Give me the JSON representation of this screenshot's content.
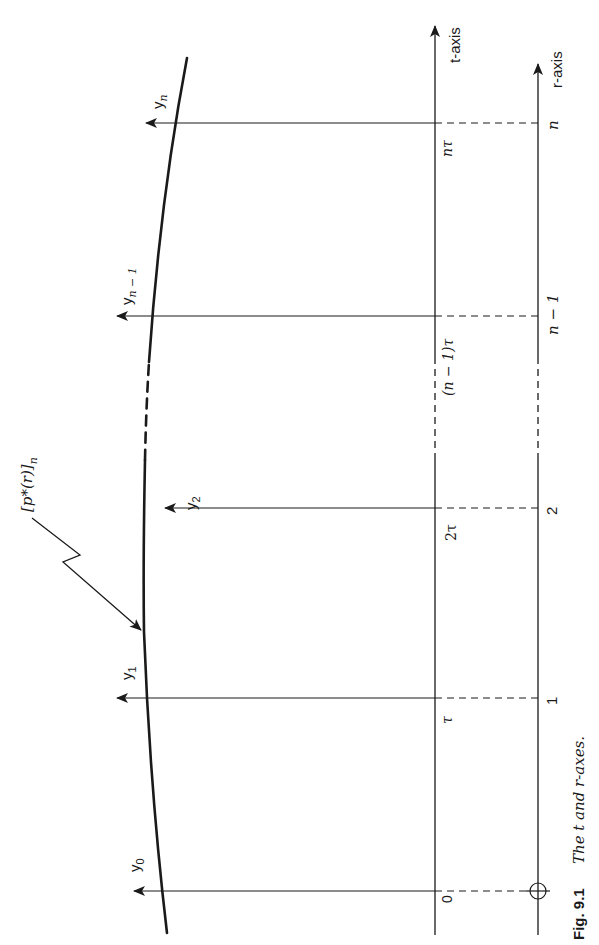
{
  "figure": {
    "number_label": "Fig. 9.1",
    "caption": "The t and r-axes.",
    "orientation": "rotated 90° counter-clockwise"
  },
  "axes": {
    "t_axis_label": "t-axis",
    "r_axis_label": "r-axis",
    "origin_marker": "circle-cross"
  },
  "t_ticks": [
    "0",
    "τ",
    "2τ",
    "(n − 1)τ",
    "nτ"
  ],
  "r_ticks": [
    "1",
    "2",
    "n − 1",
    "n"
  ],
  "ordinates": [
    {
      "label": "y",
      "sub": "0"
    },
    {
      "label": "y",
      "sub": "1"
    },
    {
      "label": "y",
      "sub": "2"
    },
    {
      "label": "y",
      "sub": "n − 1"
    },
    {
      "label": "y",
      "sub": "n"
    }
  ],
  "curve_label": {
    "main": "[p*(r)]",
    "sub": "n"
  },
  "colors": {
    "ink": "#1a1a1a",
    "background": "#ffffff"
  }
}
